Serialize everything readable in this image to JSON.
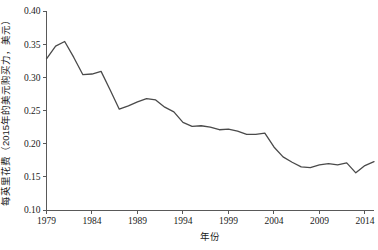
{
  "chart_data": {
    "type": "line",
    "title": "",
    "xlabel": "年份",
    "ylabel": "每英里花费（2015年的美元购买力，美元）",
    "xlim": [
      1979,
      2015
    ],
    "ylim": [
      0.1,
      0.4
    ],
    "grid": false,
    "legend_position": "none",
    "x_ticks": [
      "1979",
      "1984",
      "1989",
      "1994",
      "1999",
      "2004",
      "2009",
      "2014"
    ],
    "x_tick_values": [
      1979,
      1984,
      1989,
      1994,
      1999,
      2004,
      2009,
      2014
    ],
    "y_ticks": [
      "0.10",
      "0.15",
      "0.20",
      "0.25",
      "0.30",
      "0.35",
      "0.40"
    ],
    "y_tick_values": [
      0.1,
      0.15,
      0.2,
      0.25,
      0.3,
      0.35,
      0.4
    ],
    "line_color": "#4a4a4a",
    "axis_color": "#595959",
    "x": [
      1979,
      1980,
      1981,
      1982,
      1983,
      1984,
      1985,
      1986,
      1987,
      1988,
      1989,
      1990,
      1991,
      1992,
      1993,
      1994,
      1995,
      1996,
      1997,
      1998,
      1999,
      2000,
      2001,
      2002,
      2003,
      2004,
      2005,
      2006,
      2007,
      2008,
      2009,
      2010,
      2011,
      2012,
      2013,
      2014,
      2015
    ],
    "series": [
      {
        "name": "每英里花费",
        "values": [
          0.328,
          0.347,
          0.354,
          0.33,
          0.304,
          0.305,
          0.309,
          0.281,
          0.252,
          0.257,
          0.263,
          0.268,
          0.266,
          0.255,
          0.248,
          0.232,
          0.226,
          0.227,
          0.225,
          0.221,
          0.222,
          0.219,
          0.214,
          0.214,
          0.216,
          0.195,
          0.18,
          0.172,
          0.165,
          0.164,
          0.168,
          0.17,
          0.168,
          0.171,
          0.156,
          0.167,
          0.173
        ]
      }
    ],
    "annotations": []
  },
  "axis": {
    "y_label": "每英里花费（2015年的美元购买力，美元）",
    "x_label": "年份"
  }
}
